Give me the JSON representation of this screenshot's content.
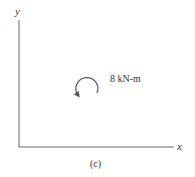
{
  "figure": {
    "axes": {
      "y_label": "y",
      "x_label": "x"
    },
    "moment": {
      "label": "8 kN-m",
      "direction": "counterclockwise"
    },
    "caption": "(c)"
  },
  "colors": {
    "axis": "#555555",
    "text": "#333333",
    "background": "#ffffff"
  }
}
